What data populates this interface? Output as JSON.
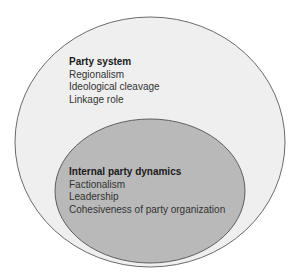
{
  "diagram": {
    "type": "nested-ellipses",
    "colors": {
      "outer_fill": "#efefef",
      "inner_fill": "#b9b9b9",
      "stroke": "#6a6a6a",
      "background": "#ffffff"
    },
    "outer": {
      "title": "Party system",
      "items": [
        "Regionalism",
        "Ideological cleavage",
        "Linkage role"
      ]
    },
    "inner": {
      "title": "Internal party dynamics",
      "items": [
        "Factionalism",
        "Leadership",
        "Cohesiveness of party organization"
      ]
    }
  }
}
